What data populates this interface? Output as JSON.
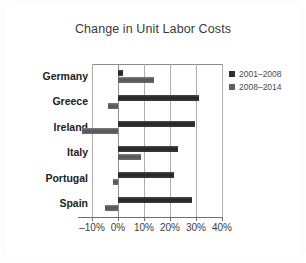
{
  "chart_data": {
    "type": "bar",
    "orientation": "horizontal",
    "title": "Change in Unit Labor Costs",
    "xlabel": "",
    "ylabel": "",
    "xlim": [
      -10,
      40
    ],
    "xticks": [
      -10,
      0,
      10,
      20,
      30,
      40
    ],
    "xticklabels": [
      "–10%",
      "0%",
      "10%",
      "20%",
      "30%",
      "40%"
    ],
    "grid": "vertical",
    "legend_position": "right",
    "categories": [
      "Germany",
      "Greece",
      "Ireland",
      "Italy",
      "Portugal",
      "Spain"
    ],
    "series": [
      {
        "name": "2001–2008",
        "color": "#2e2e2e",
        "values": [
          2,
          31,
          29.5,
          23,
          21.5,
          28.5
        ]
      },
      {
        "name": "2008–2014",
        "color": "#606060",
        "values": [
          14,
          -4,
          -14,
          9,
          -2,
          -5
        ]
      }
    ]
  },
  "legend": {
    "items": [
      {
        "label": "2001–2008"
      },
      {
        "label": "2008–2014"
      }
    ]
  }
}
